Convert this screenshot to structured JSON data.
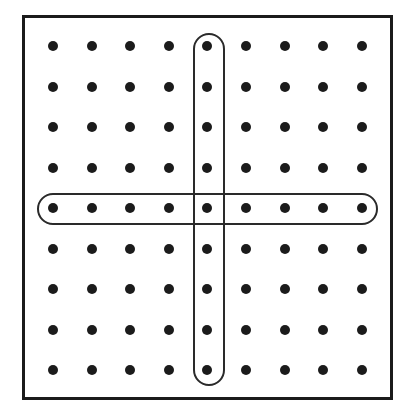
{
  "figure": {
    "width": 407,
    "height": 414,
    "background_color": "#ffffff"
  },
  "frame": {
    "name": "array-border",
    "x": 22,
    "y": 15,
    "width": 371,
    "height": 385,
    "border_width": 3,
    "border_color": "#1b1b1b",
    "fill_color": "#ffffff"
  },
  "grid": {
    "columns": 9,
    "rows": 9,
    "origin_x": 53,
    "origin_y": 46,
    "col_spacing": 38.6,
    "row_spacing": 40.5,
    "dot_diameter": 10,
    "dot_color": "#1b1b1b",
    "total_dots": 81,
    "column_labels": [
      "1",
      "2",
      "3",
      "4",
      "5",
      "6",
      "7",
      "8",
      "9"
    ],
    "row_labels": [
      "1",
      "2",
      "3",
      "4",
      "5",
      "6",
      "7",
      "8",
      "9"
    ]
  },
  "highlights": [
    {
      "name": "column-highlight",
      "orientation": "vertical",
      "selected_index": 5,
      "covers": "column 5, rows 1 through 9",
      "dot_count": 9,
      "x": 193,
      "y": 33,
      "width": 32,
      "height": 353,
      "corner_radius": 16,
      "stroke_width": 2,
      "stroke_color": "#2a2a2a"
    },
    {
      "name": "row-highlight",
      "orientation": "horizontal",
      "selected_index": 5,
      "covers": "row 5, columns 1 through 9",
      "dot_count": 9,
      "x": 37,
      "y": 193,
      "width": 341,
      "height": 32,
      "corner_radius": 16,
      "stroke_width": 2,
      "stroke_color": "#2a2a2a"
    }
  ]
}
